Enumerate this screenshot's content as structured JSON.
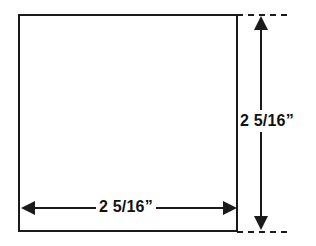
{
  "drawing": {
    "title": "Square with dimension annotations",
    "shape": {
      "name": "square",
      "fill_color": "#ffffff",
      "stroke_color": "#1a1a1a"
    },
    "dimensions": {
      "width": {
        "label": "2  5/16”",
        "whole": "2",
        "fraction": "5/16",
        "unit": "inches",
        "orientation": "horizontal"
      },
      "height": {
        "label": "2  5/16”",
        "whole": "2",
        "fraction": "5/16",
        "unit": "inches",
        "orientation": "vertical"
      }
    },
    "annotations": {
      "arrow_up": "arrow-up-icon",
      "arrow_down": "arrow-down-icon",
      "arrow_left": "arrow-left-icon",
      "arrow_right": "arrow-right-icon",
      "extension_line_top": "dashed-extension-line",
      "extension_line_bottom": "dashed-extension-line"
    },
    "colors": {
      "line": "#1a1a1a",
      "text": "#111111",
      "background": "#ffffff"
    }
  }
}
